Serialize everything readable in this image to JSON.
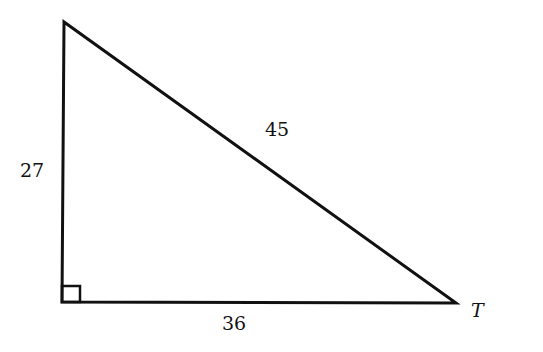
{
  "diagram": {
    "type": "right-triangle",
    "vertices": {
      "top": [
        64,
        22
      ],
      "right_angle": [
        62,
        302
      ],
      "T": [
        457,
        303
      ]
    },
    "labels": {
      "left_side": "27",
      "hypotenuse": "45",
      "bottom_side": "36",
      "vertex_T": "T"
    },
    "stroke_color": "#111111"
  }
}
